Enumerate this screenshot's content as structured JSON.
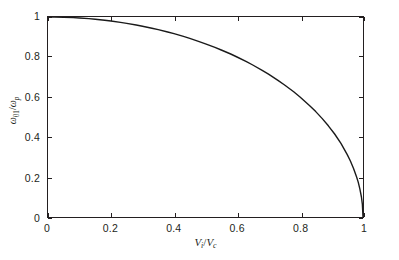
{
  "figure": {
    "background_color": "#ffffff",
    "axis_color": "#231f20",
    "curve_color": "#1a1a1a"
  },
  "axes": {
    "xlabel_parts": {
      "num_var": "V",
      "num_sub": "i",
      "slash": "/",
      "den_var": "V",
      "den_sub": "c"
    },
    "ylabel_parts": {
      "num_var": "ω",
      "num_sub": "01",
      "slash": "/",
      "den_var": "ω",
      "den_sub": "p"
    },
    "xticklabels": [
      "0",
      "0.2",
      "0.4",
      "0.6",
      "0.8",
      "1"
    ],
    "yticklabels": [
      "0",
      "0.2",
      "0.4",
      "0.6",
      "0.8",
      "1"
    ]
  },
  "chart_data": {
    "type": "line",
    "title": "",
    "xlabel": "V_i/V_c",
    "ylabel": "ω_01/ω_p",
    "xlim": [
      0,
      1
    ],
    "ylim": [
      0,
      1
    ],
    "xticks": [
      0,
      0.2,
      0.4,
      0.6,
      0.8,
      1
    ],
    "yticks": [
      0,
      0.2,
      0.4,
      0.6,
      0.8,
      1
    ],
    "grid": false,
    "legend": false,
    "series": [
      {
        "name": "ω_01/ω_p vs V_i/V_c",
        "color": "#1a1a1a",
        "linewidth": 1.4,
        "x": [
          0.0,
          0.02,
          0.05,
          0.08,
          0.1,
          0.13,
          0.15,
          0.18,
          0.2,
          0.23,
          0.25,
          0.28,
          0.3,
          0.33,
          0.35,
          0.38,
          0.4,
          0.43,
          0.45,
          0.48,
          0.5,
          0.53,
          0.55,
          0.58,
          0.6,
          0.63,
          0.65,
          0.68,
          0.7,
          0.73,
          0.75,
          0.78,
          0.8,
          0.83,
          0.85,
          0.87,
          0.89,
          0.91,
          0.93,
          0.95,
          0.96,
          0.97,
          0.98,
          0.985,
          0.99,
          0.995,
          0.998,
          1.0
        ],
        "y": [
          1.0,
          1.0,
          0.999,
          0.997,
          0.995,
          0.992,
          0.989,
          0.984,
          0.98,
          0.973,
          0.968,
          0.96,
          0.954,
          0.944,
          0.937,
          0.925,
          0.917,
          0.903,
          0.893,
          0.877,
          0.866,
          0.848,
          0.835,
          0.815,
          0.8,
          0.777,
          0.76,
          0.733,
          0.714,
          0.683,
          0.661,
          0.626,
          0.6,
          0.558,
          0.527,
          0.493,
          0.456,
          0.415,
          0.368,
          0.312,
          0.28,
          0.243,
          0.199,
          0.173,
          0.141,
          0.1,
          0.063,
          0.0
        ]
      }
    ]
  },
  "ticks": {
    "x_positions_frac": [
      0,
      0.2,
      0.4,
      0.6,
      0.8,
      1
    ],
    "y_positions_frac": [
      0,
      0.2,
      0.4,
      0.6,
      0.8,
      1
    ]
  }
}
